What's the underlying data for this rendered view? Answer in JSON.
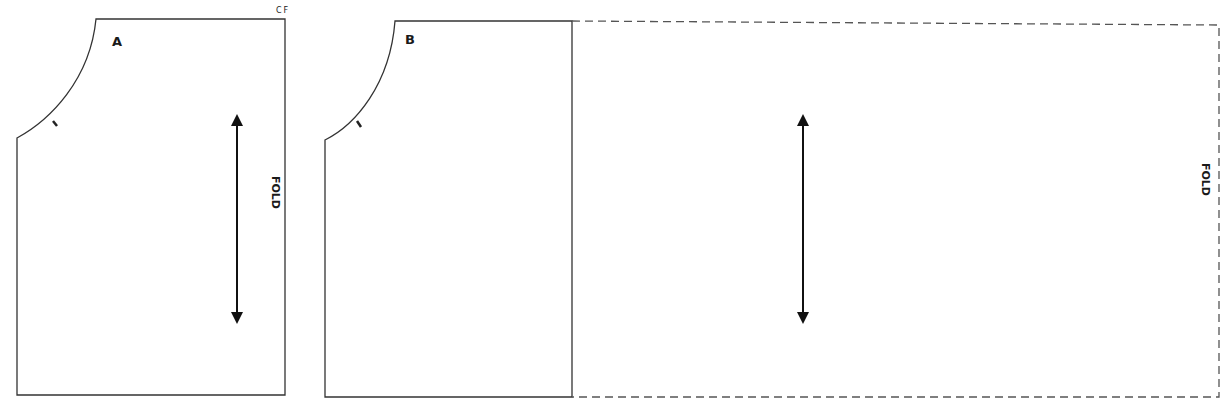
{
  "diagram": {
    "type": "sewing-pattern",
    "pieces": [
      {
        "id": "A",
        "label": "A",
        "corner_label": "CF",
        "fold_label": "FOLD",
        "grainline": "vertical-double-arrow"
      },
      {
        "id": "B",
        "label": "B",
        "fold_label": "FOLD",
        "grainline": "vertical-double-arrow",
        "extension": "dashed"
      }
    ]
  },
  "colors": {
    "line": "#333333",
    "dashed": "#555555",
    "background": "#ffffff"
  }
}
